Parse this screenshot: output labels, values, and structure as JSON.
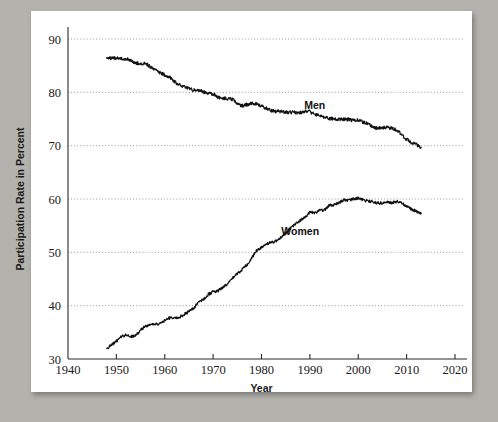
{
  "figure": {
    "background_color": "#b4b2ad",
    "panel_color": "#ffffff",
    "line_color": "#111111",
    "grid_color": "#8a8a8a"
  },
  "labels": {
    "y_axis_title": "Participation Rate in Percent",
    "x_axis_title": "Year",
    "series_men": "Men",
    "series_women": "Women"
  },
  "chart_data": {
    "type": "line",
    "title": "",
    "xlabel": "Year",
    "ylabel": "Participation Rate in Percent",
    "xlim": [
      1940,
      2020
    ],
    "ylim": [
      30,
      90
    ],
    "xticks": [
      1940,
      1950,
      1960,
      1970,
      1980,
      1990,
      2000,
      2010,
      2020
    ],
    "yticks": [
      30,
      40,
      50,
      60,
      70,
      80,
      90
    ],
    "grid": "horizontal-dotted",
    "legend": "inline-annotations",
    "annotations": [
      {
        "text": "Men",
        "x": 1991,
        "y": 76.8
      },
      {
        "text": "Women",
        "x": 1988,
        "y": 53.2
      }
    ],
    "series": [
      {
        "name": "Men",
        "x": [
          1948,
          1949,
          1950,
          1951,
          1952,
          1953,
          1954,
          1955,
          1956,
          1957,
          1958,
          1959,
          1960,
          1961,
          1962,
          1963,
          1964,
          1965,
          1966,
          1967,
          1968,
          1969,
          1970,
          1971,
          1972,
          1973,
          1974,
          1975,
          1976,
          1977,
          1978,
          1979,
          1980,
          1981,
          1982,
          1983,
          1984,
          1985,
          1986,
          1987,
          1988,
          1989,
          1990,
          1991,
          1992,
          1993,
          1994,
          1995,
          1996,
          1997,
          1998,
          1999,
          2000,
          2001,
          2002,
          2003,
          2004,
          2005,
          2006,
          2007,
          2008,
          2009,
          2010,
          2011,
          2012,
          2013
        ],
        "values": [
          86.6,
          86.4,
          86.4,
          86.3,
          86.3,
          86.0,
          85.5,
          85.4,
          85.5,
          84.8,
          84.2,
          83.7,
          83.3,
          82.9,
          82.0,
          81.4,
          81.0,
          80.7,
          80.4,
          80.4,
          80.1,
          79.8,
          79.7,
          79.1,
          78.9,
          78.8,
          78.7,
          77.9,
          77.5,
          77.7,
          77.9,
          77.8,
          77.4,
          77.0,
          76.6,
          76.4,
          76.4,
          76.3,
          76.3,
          76.2,
          76.2,
          76.4,
          76.4,
          75.8,
          75.8,
          75.4,
          75.1,
          75.0,
          74.9,
          75.0,
          74.9,
          74.7,
          74.8,
          74.4,
          74.1,
          73.5,
          73.3,
          73.3,
          73.5,
          73.2,
          73.0,
          72.0,
          71.2,
          70.5,
          70.2,
          69.7
        ]
      },
      {
        "name": "Women",
        "x": [
          1948,
          1949,
          1950,
          1951,
          1952,
          1953,
          1954,
          1955,
          1956,
          1957,
          1958,
          1959,
          1960,
          1961,
          1962,
          1963,
          1964,
          1965,
          1966,
          1967,
          1968,
          1969,
          1970,
          1971,
          1972,
          1973,
          1974,
          1975,
          1976,
          1977,
          1978,
          1979,
          1980,
          1981,
          1982,
          1983,
          1984,
          1985,
          1986,
          1987,
          1988,
          1989,
          1990,
          1991,
          1992,
          1993,
          1994,
          1995,
          1996,
          1997,
          1998,
          1999,
          2000,
          2001,
          2002,
          2003,
          2004,
          2005,
          2006,
          2007,
          2008,
          2009,
          2010,
          2011,
          2012,
          2013
        ],
        "values": [
          32.0,
          32.6,
          33.3,
          34.2,
          34.5,
          34.2,
          34.4,
          35.4,
          36.2,
          36.4,
          36.5,
          36.7,
          37.2,
          37.7,
          37.6,
          37.8,
          38.3,
          38.9,
          39.6,
          40.6,
          41.2,
          42.1,
          42.6,
          42.8,
          43.4,
          44.2,
          45.2,
          45.9,
          46.8,
          47.7,
          49.0,
          50.3,
          50.9,
          51.5,
          51.9,
          52.1,
          52.8,
          53.6,
          54.5,
          55.3,
          56.0,
          56.6,
          57.5,
          57.4,
          57.8,
          57.9,
          58.8,
          58.9,
          59.3,
          59.8,
          59.8,
          60.0,
          60.2,
          59.8,
          59.6,
          59.5,
          59.2,
          59.3,
          59.4,
          59.3,
          59.5,
          59.2,
          58.6,
          58.1,
          57.7,
          57.2
        ]
      }
    ]
  }
}
